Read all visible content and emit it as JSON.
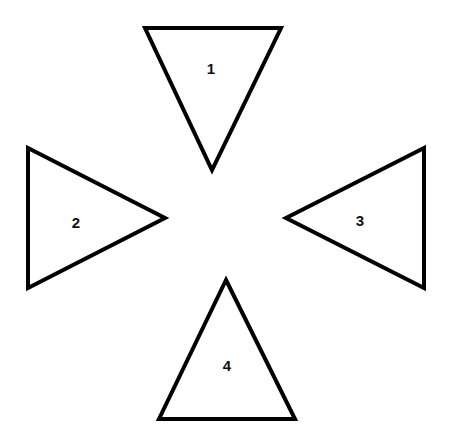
{
  "diagram": {
    "background": "#ffffff",
    "stroke_color": "#000000",
    "shapes": [
      {
        "id": "triangle-1",
        "label": "1",
        "direction": "down",
        "points": "145,28 281,28 212,170",
        "label_pos": [
          211,
          68
        ]
      },
      {
        "id": "triangle-2",
        "label": "2",
        "direction": "right",
        "points": "28,148 28,288 165,218",
        "label_pos": [
          76,
          222
        ]
      },
      {
        "id": "triangle-3",
        "label": "3",
        "direction": "left",
        "points": "424,148 424,288 286,218",
        "label_pos": [
          360,
          220
        ]
      },
      {
        "id": "triangle-4",
        "label": "4",
        "direction": "up",
        "points": "226,280 295,419 159,419",
        "label_pos": [
          227,
          365
        ]
      }
    ]
  }
}
